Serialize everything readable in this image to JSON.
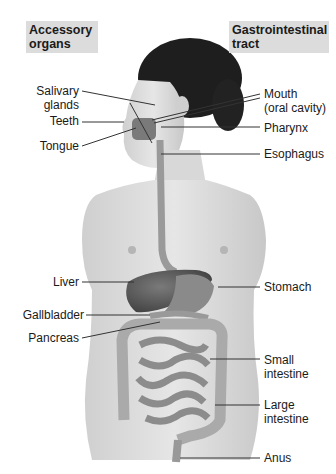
{
  "headings": {
    "left": [
      "Accessory",
      "organs"
    ],
    "right": [
      "Gastrointestinal",
      "tract"
    ]
  },
  "left_labels": [
    {
      "id": "salivary-glands",
      "lines": [
        "Salivary",
        "glands"
      ]
    },
    {
      "id": "teeth",
      "lines": [
        "Teeth"
      ]
    },
    {
      "id": "tongue",
      "lines": [
        "Tongue"
      ]
    },
    {
      "id": "liver",
      "lines": [
        "Liver"
      ]
    },
    {
      "id": "gallbladder",
      "lines": [
        "Gallbladder"
      ]
    },
    {
      "id": "pancreas",
      "lines": [
        "Pancreas"
      ]
    }
  ],
  "right_labels": [
    {
      "id": "mouth",
      "lines": [
        "Mouth",
        "(oral cavity)"
      ]
    },
    {
      "id": "pharynx",
      "lines": [
        "Pharynx"
      ]
    },
    {
      "id": "esophagus",
      "lines": [
        "Esophagus"
      ]
    },
    {
      "id": "stomach",
      "lines": [
        "Stomach"
      ]
    },
    {
      "id": "small-intestine",
      "lines": [
        "Small",
        "intestine"
      ]
    },
    {
      "id": "large-intestine",
      "lines": [
        "Large",
        "intestine"
      ]
    },
    {
      "id": "anus",
      "lines": [
        "Anus"
      ]
    }
  ],
  "colors": {
    "heading_bg": "#dcdcdc",
    "text": "#1a1a1a",
    "skin": "#d6d6d6",
    "hair": "#1e1e1e",
    "organ": "#6a6a6a",
    "leader_line": "#333333"
  }
}
